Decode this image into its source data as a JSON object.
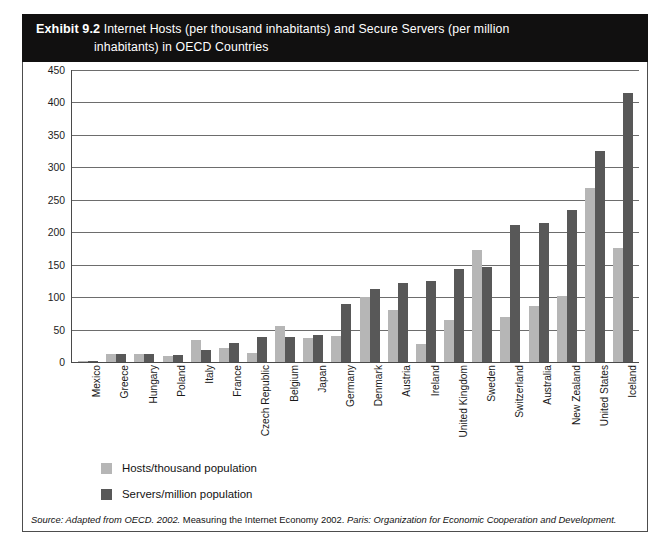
{
  "exhibit": {
    "label": "Exhibit 9.2",
    "title_line1": "Internet Hosts (per thousand inhabitants) and Secure Servers (per million",
    "title_line2": "inhabitants) in OECD Countries"
  },
  "legend": {
    "items": [
      {
        "label": "Hosts/thousand population",
        "color": "#b6b6b6",
        "swatch": "light"
      },
      {
        "label": "Servers/million population",
        "color": "#585858",
        "swatch": "dark"
      }
    ]
  },
  "source": {
    "prefix": "Source: Adapted from OECD. 2002.",
    "middle": " Measuring the Internet Economy 2002. ",
    "suffix": "Paris: Organization for Economic Cooperation and Development.",
    "full": "Source: Adapted from OECD. 2002. Measuring the Internet Economy 2002. Paris: Organization for Economic Cooperation and Development."
  },
  "chart_data": {
    "type": "bar",
    "title": "Internet Hosts (per thousand inhabitants) and Secure Servers (per million inhabitants) in OECD Countries",
    "xlabel": "",
    "ylabel": "",
    "ylim": [
      0,
      450
    ],
    "yticks": [
      0,
      50,
      100,
      150,
      200,
      250,
      300,
      350,
      400,
      450
    ],
    "grid": true,
    "legend_position": "below-left",
    "categories": [
      "Mexico",
      "Greece",
      "Hungary",
      "Poland",
      "Italy",
      "France",
      "Czech Republic",
      "Belgium",
      "Japan",
      "Germany",
      "Denmark",
      "Austria",
      "Ireland",
      "United Kingdom",
      "Sweden",
      "Switzerland",
      "Australia",
      "New Zealand",
      "United States",
      "Iceland"
    ],
    "series": [
      {
        "name": "Hosts/thousand population",
        "color": "#b6b6b6",
        "values": [
          1,
          12,
          13,
          10,
          34,
          21,
          14,
          55,
          37,
          40,
          100,
          80,
          28,
          65,
          172,
          70,
          87,
          102,
          268,
          175
        ]
      },
      {
        "name": "Servers/million population",
        "color": "#585858",
        "values": [
          2,
          13,
          13,
          11,
          18,
          30,
          38,
          39,
          42,
          90,
          112,
          122,
          125,
          143,
          147,
          211,
          215,
          235,
          325,
          415
        ]
      }
    ]
  }
}
